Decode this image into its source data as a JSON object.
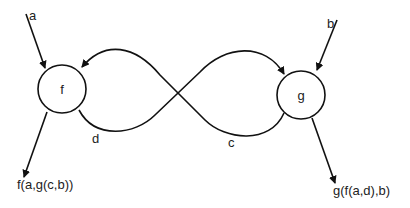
{
  "diagram": {
    "type": "string-diagram",
    "nodes": [
      {
        "id": "f",
        "label": "f"
      },
      {
        "id": "g",
        "label": "g"
      }
    ],
    "inputs": [
      {
        "label": "a",
        "target": "f"
      },
      {
        "label": "b",
        "target": "g"
      }
    ],
    "feedback_wires": [
      {
        "label": "d",
        "from": "f",
        "to": "g"
      },
      {
        "label": "c",
        "from": "g",
        "to": "f"
      }
    ],
    "outputs": [
      {
        "label": "f(a,g(c,b))",
        "source": "f"
      },
      {
        "label": "g(f(a,d),b)",
        "source": "g"
      }
    ],
    "colors": {
      "stroke": "#111111",
      "text": "#222222",
      "background": "#ffffff"
    }
  }
}
